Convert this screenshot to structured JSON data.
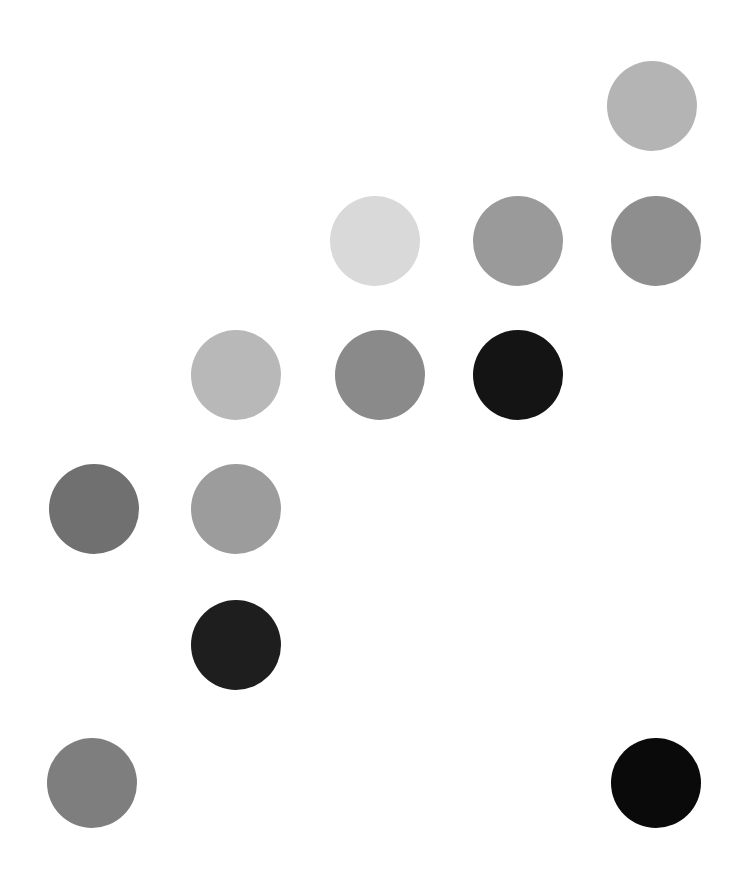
{
  "canvas": {
    "width": 736,
    "height": 895,
    "background": "#ffffff",
    "title": "Grayscale Circle Scatter"
  },
  "chart_data": {
    "type": "scatter",
    "title": "",
    "subtitle": "",
    "xlabel": "",
    "ylabel": "",
    "xlim": [
      0,
      736
    ],
    "ylim": [
      0,
      895
    ],
    "grid": false,
    "legend": null,
    "axes_visible": false,
    "tick_labels_x": [],
    "tick_labels_y": [],
    "annotations": [],
    "marker": "circle",
    "marker_diameter": 90,
    "background": "#ffffff",
    "points": [
      {
        "id": "p01",
        "row": 1,
        "col": 5,
        "cx": 652,
        "cy": 106,
        "d": 90,
        "color": "#b4b4b4",
        "label": "row1-col5"
      },
      {
        "id": "p02",
        "row": 2,
        "col": 3,
        "cx": 375,
        "cy": 241,
        "d": 90,
        "color": "#d9d9d9",
        "label": "row2-col3"
      },
      {
        "id": "p03",
        "row": 2,
        "col": 4,
        "cx": 518,
        "cy": 241,
        "d": 90,
        "color": "#9a9a9a",
        "label": "row2-col4"
      },
      {
        "id": "p04",
        "row": 2,
        "col": 5,
        "cx": 656,
        "cy": 241,
        "d": 90,
        "color": "#8e8e8e",
        "label": "row2-col5"
      },
      {
        "id": "p05",
        "row": 3,
        "col": 2,
        "cx": 236,
        "cy": 375,
        "d": 90,
        "color": "#b8b8b8",
        "label": "row3-col2"
      },
      {
        "id": "p06",
        "row": 3,
        "col": 3,
        "cx": 380,
        "cy": 375,
        "d": 90,
        "color": "#8a8a8a",
        "label": "row3-col3"
      },
      {
        "id": "p07",
        "row": 3,
        "col": 4,
        "cx": 518,
        "cy": 375,
        "d": 90,
        "color": "#141414",
        "label": "row3-col4"
      },
      {
        "id": "p08",
        "row": 4,
        "col": 1,
        "cx": 94,
        "cy": 509,
        "d": 90,
        "color": "#707070",
        "label": "row4-col1"
      },
      {
        "id": "p09",
        "row": 4,
        "col": 2,
        "cx": 236,
        "cy": 509,
        "d": 90,
        "color": "#9c9c9c",
        "label": "row4-col2"
      },
      {
        "id": "p10",
        "row": 5,
        "col": 2,
        "cx": 236,
        "cy": 645,
        "d": 90,
        "color": "#1e1e1e",
        "label": "row5-col2"
      },
      {
        "id": "p11",
        "row": 6,
        "col": 1,
        "cx": 92,
        "cy": 783,
        "d": 90,
        "color": "#7e7e7e",
        "label": "row6-col1"
      },
      {
        "id": "p12",
        "row": 6,
        "col": 5,
        "cx": 656,
        "cy": 783,
        "d": 90,
        "color": "#0a0a0a",
        "label": "row6-col5"
      }
    ]
  }
}
